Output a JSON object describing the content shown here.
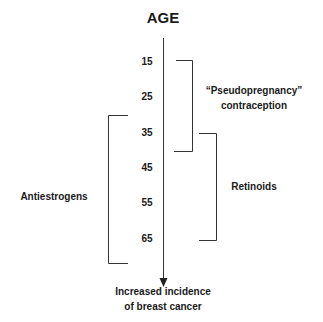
{
  "diagram": {
    "title": "AGE",
    "axis": {
      "direction": "down",
      "ticks": [
        "15",
        "25",
        "35",
        "45",
        "55",
        "65"
      ],
      "end_label_line1": "Increased incidence",
      "end_label_line2": "of breast cancer"
    },
    "brackets": [
      {
        "label_line1": "“Pseudopregnancy”",
        "label_line2": "contraception",
        "from_age": "15",
        "to_age": "40",
        "side": "right"
      },
      {
        "label": "Retinoids",
        "from_age": "35",
        "to_age": "65",
        "side": "right"
      },
      {
        "label": "Antiestrogens",
        "from_age": "30",
        "to_age": "70",
        "side": "left"
      }
    ]
  }
}
